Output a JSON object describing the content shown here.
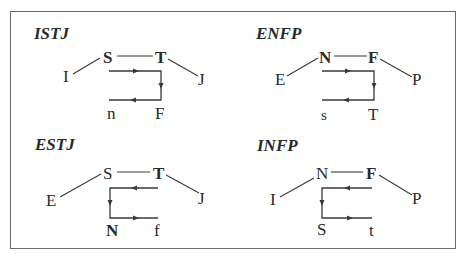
{
  "diagrams": [
    {
      "title": "ISTJ",
      "nodes": {
        "dominant": "S",
        "auxiliary": "T",
        "attitude": "I",
        "lifestyle": "J",
        "tertiary": "F",
        "inferior": "n"
      },
      "flow": "S → T → F → n"
    },
    {
      "title": "ENFP",
      "nodes": {
        "dominant": "N",
        "auxiliary": "F",
        "attitude": "E",
        "lifestyle": "P",
        "tertiary": "T",
        "inferior": "s"
      },
      "flow": "N → F → T → s"
    },
    {
      "title": "ESTJ",
      "nodes": {
        "dominant": "T",
        "auxiliary": "S",
        "attitude": "E",
        "lifestyle": "J",
        "tertiary": "N",
        "inferior": "f"
      },
      "flow": "T → S → N → f"
    },
    {
      "title": "INFP",
      "nodes": {
        "dominant": "F",
        "auxiliary": "N",
        "attitude": "I",
        "lifestyle": "P",
        "tertiary": "S",
        "inferior": "t"
      },
      "flow": "F → N → S → t"
    }
  ],
  "colors": {
    "line": "#3a3a3a",
    "text": "#2a2a2a",
    "border": "#6b6b6b",
    "background": "#ffffff"
  }
}
